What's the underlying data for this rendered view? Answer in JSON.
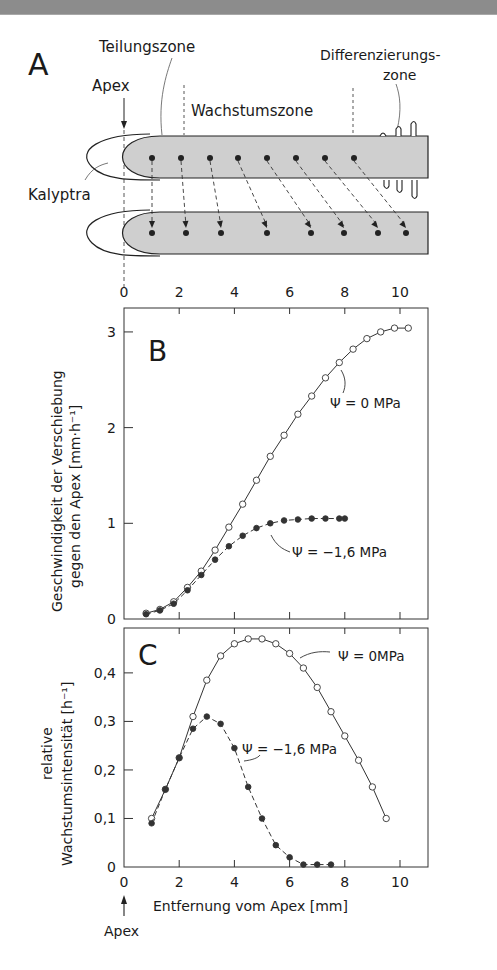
{
  "panel_a": {
    "label": "A",
    "labels": {
      "division_zone": "Teilungszone",
      "differentiation_zone_1": "Differenzierungs-",
      "differentiation_zone_2": "zone",
      "apex": "Apex",
      "growth_zone": "Wachstumszone",
      "calyptra": "Kalyptra"
    },
    "axis_ticks": [
      "0",
      "2",
      "4",
      "6",
      "8",
      "10"
    ]
  },
  "chart_data": [
    {
      "panel": "B",
      "type": "line",
      "title": "",
      "xlabel": "Entfernung vom Apex [mm]",
      "ylabel_line1": "Geschwindigkeit der Verschiebung",
      "ylabel_line2": "gegen den Apex [mm·h⁻¹]",
      "xlim": [
        0,
        11
      ],
      "ylim": [
        0,
        3.2
      ],
      "xticks": [
        "0",
        "2",
        "4",
        "6",
        "8",
        "10"
      ],
      "yticks": [
        "0",
        "1",
        "2",
        "3"
      ],
      "grid": false,
      "series": [
        {
          "name": "Ψ = 0 MPa",
          "marker": "open-circle",
          "line": "solid",
          "x": [
            0.8,
            1.3,
            1.8,
            2.3,
            2.8,
            3.3,
            3.8,
            4.3,
            4.8,
            5.3,
            5.8,
            6.3,
            6.8,
            7.3,
            7.8,
            8.3,
            8.8,
            9.3,
            9.8,
            10.3
          ],
          "y": [
            0.06,
            0.1,
            0.18,
            0.33,
            0.5,
            0.72,
            0.96,
            1.2,
            1.45,
            1.7,
            1.92,
            2.14,
            2.33,
            2.52,
            2.68,
            2.82,
            2.93,
            3.0,
            3.04,
            3.04
          ]
        },
        {
          "name": "Ψ = −1,6 MPa",
          "marker": "filled-circle",
          "line": "dashed",
          "x": [
            0.8,
            1.3,
            1.8,
            2.3,
            2.8,
            3.3,
            3.8,
            4.3,
            4.8,
            5.3,
            5.8,
            6.3,
            6.8,
            7.3,
            7.8,
            8.0
          ],
          "y": [
            0.05,
            0.09,
            0.16,
            0.3,
            0.46,
            0.62,
            0.76,
            0.87,
            0.95,
            1.0,
            1.03,
            1.04,
            1.05,
            1.05,
            1.05,
            1.05
          ]
        }
      ],
      "annotations": [
        "B",
        "Ψ = 0 MPa",
        "Ψ = −1,6 MPa"
      ]
    },
    {
      "panel": "C",
      "type": "line",
      "title": "",
      "xlabel": "Entfernung vom Apex [mm]",
      "ylabel_line1": "relative",
      "ylabel_line2": "Wachstumsintensität [h⁻¹]",
      "xlim": [
        0,
        11
      ],
      "ylim": [
        0,
        0.5
      ],
      "xticks": [
        "0",
        "2",
        "4",
        "6",
        "8",
        "10"
      ],
      "yticks": [
        "0",
        "0,1",
        "0,2",
        "0,3",
        "0,4"
      ],
      "grid": false,
      "series": [
        {
          "name": "Ψ = 0 MPa",
          "marker": "open-circle",
          "line": "solid",
          "x": [
            1.0,
            1.5,
            2.0,
            2.5,
            3.0,
            3.5,
            4.0,
            4.5,
            5.0,
            5.5,
            6.0,
            6.5,
            7.0,
            7.5,
            8.0,
            8.5,
            9.0,
            9.5
          ],
          "y": [
            0.1,
            0.16,
            0.225,
            0.31,
            0.385,
            0.435,
            0.46,
            0.47,
            0.47,
            0.46,
            0.44,
            0.41,
            0.37,
            0.32,
            0.27,
            0.22,
            0.165,
            0.1
          ]
        },
        {
          "name": "Ψ = −1,6 MPa",
          "marker": "filled-circle",
          "line": "dashed",
          "x": [
            1.0,
            1.5,
            2.0,
            2.5,
            3.0,
            3.5,
            4.0,
            4.5,
            5.0,
            5.5,
            6.0,
            6.5,
            7.0,
            7.5
          ],
          "y": [
            0.09,
            0.16,
            0.225,
            0.285,
            0.31,
            0.295,
            0.245,
            0.165,
            0.1,
            0.045,
            0.02,
            0.005,
            0.005,
            0.005
          ]
        }
      ],
      "annotations": [
        "C",
        "Ψ = 0MPa",
        "Ψ = −1,6 MPa"
      ]
    }
  ],
  "bottom": {
    "apex_label": "Apex",
    "xlabel": "Entfernung vom Apex [mm]"
  },
  "colors": {
    "root_fill": "#cfcfcf",
    "ink": "#1a1a1a",
    "topbar": "#8c8c8c"
  }
}
